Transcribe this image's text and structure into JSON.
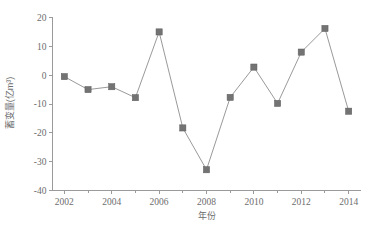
{
  "chart_data": {
    "type": "line",
    "title": "",
    "xlabel": "年份",
    "ylabel": "蓄变量(亿m³)",
    "x": [
      2002,
      2003,
      2004,
      2005,
      2006,
      2007,
      2008,
      2009,
      2010,
      2011,
      2012,
      2013,
      2014
    ],
    "values": [
      -0.5,
      -5.0,
      -4.0,
      -7.8,
      15.0,
      -18.3,
      -32.8,
      -7.7,
      2.8,
      -9.8,
      8.0,
      16.2,
      -12.5
    ],
    "series": [
      {
        "name": "蓄变量",
        "values": [
          -0.5,
          -5.0,
          -4.0,
          -7.8,
          15.0,
          -18.3,
          -32.8,
          -7.7,
          2.8,
          -9.8,
          8.0,
          16.2,
          -12.5
        ]
      }
    ],
    "xlim": [
      2001.5,
      2014.5
    ],
    "ylim": [
      -40,
      20
    ],
    "xticks": [
      2002,
      2004,
      2006,
      2008,
      2010,
      2012,
      2014
    ],
    "xtick_labels": [
      "2002",
      "2004",
      "2006",
      "2008",
      "2010",
      "2012",
      "2014"
    ],
    "xminor_ticks": [
      2003,
      2005,
      2007,
      2009,
      2011,
      2013
    ],
    "yticks": [
      20,
      10,
      0,
      -10,
      -20,
      -30,
      -40
    ],
    "ytick_labels": [
      "20",
      "10",
      "0",
      "-10",
      "-20",
      "-30",
      "-40"
    ],
    "grid": false,
    "legend": null,
    "marker": "square",
    "colors": {
      "line": "#8d8d8d",
      "marker": "#737373",
      "axis": "#9a9a9a",
      "text": "#6d6d6d",
      "background": "#ffffff"
    }
  },
  "caption": {
    "text": ""
  }
}
